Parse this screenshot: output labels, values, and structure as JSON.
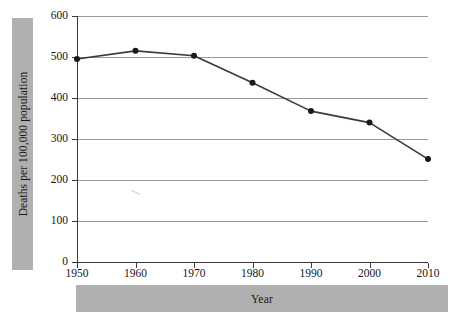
{
  "chart_data": {
    "type": "line",
    "title": "",
    "xlabel": "Year",
    "ylabel": "Deaths per 100,000 population",
    "categories": [
      1950,
      1960,
      1970,
      1980,
      1990,
      2000,
      2010
    ],
    "x_tick_labels": [
      "1950",
      "1960",
      "1970",
      "1980",
      "1990",
      "2000",
      "2010"
    ],
    "values": [
      495,
      515,
      503,
      437,
      368,
      340,
      251
    ],
    "series": [
      {
        "name": "Deaths per 100,000 population",
        "values": [
          495,
          515,
          503,
          437,
          368,
          340,
          251
        ]
      }
    ],
    "xlim": [
      1950,
      2010
    ],
    "ylim": [
      0,
      600
    ],
    "y_ticks": [
      0,
      100,
      200,
      300,
      400,
      500,
      600
    ],
    "y_tick_labels": [
      "0",
      "100",
      "200",
      "300",
      "400",
      "500",
      "600"
    ],
    "grid": "horizontal",
    "legend": "none",
    "marker": "filled-circle",
    "line_color": "#3a3a3a",
    "marker_color": "#1a1a1a",
    "gridline_color": "#9a9a9a",
    "axis_color": "#3a3a3a",
    "band_color": "#b0b0b0",
    "background_color": "#ffffff"
  },
  "axis_titles": {
    "y": "Deaths per 100,000 population",
    "x": "Year"
  }
}
